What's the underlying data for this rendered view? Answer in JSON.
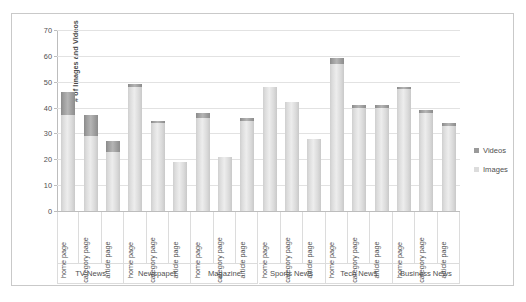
{
  "chart_data": {
    "type": "bar",
    "stacked": true,
    "title": "",
    "xlabel": "",
    "ylabel": "# of Images and Videos",
    "ylim": [
      0,
      70
    ],
    "ytick_step": 10,
    "yticks": [
      0,
      10,
      20,
      30,
      40,
      50,
      60,
      70
    ],
    "grid": true,
    "legend_position": "right",
    "groups": [
      "TV News",
      "Newspaper",
      "Magazine",
      "Sports News",
      "Tech News",
      "Business News"
    ],
    "categories": [
      "home page",
      "category page",
      "article page",
      "home page",
      "category page",
      "article page",
      "home page",
      "category page",
      "article page",
      "home page",
      "category page",
      "article page",
      "home page",
      "category page",
      "article page",
      "home page",
      "category page",
      "article page"
    ],
    "series": [
      {
        "name": "Images",
        "color": "#dcdcdc",
        "values": [
          37,
          29,
          23,
          48,
          34,
          19,
          36,
          21,
          35,
          48,
          42,
          28,
          57,
          40,
          40,
          47,
          38,
          33
        ]
      },
      {
        "name": "Videos",
        "color": "#9a9a9a",
        "values": [
          9,
          8,
          4,
          1,
          1,
          0,
          2,
          0,
          1,
          0,
          0,
          0,
          2,
          1,
          1,
          1,
          1,
          1
        ]
      }
    ],
    "totals": [
      46,
      37,
      27,
      49,
      35,
      19,
      38,
      21,
      36,
      48,
      42,
      28,
      59,
      41,
      41,
      48,
      39,
      34
    ]
  },
  "legend": {
    "items": [
      {
        "label": "Videos",
        "swatch": "videos"
      },
      {
        "label": "Images",
        "swatch": "images"
      }
    ]
  }
}
